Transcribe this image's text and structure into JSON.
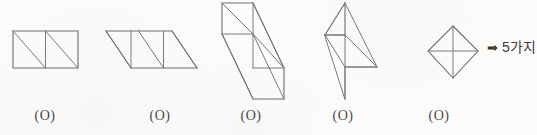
{
  "page": {
    "background_color": "#fdfcfa",
    "line_color": "#6e6e6e",
    "text_color": "#3a3a3a"
  },
  "figures": [
    {
      "id": "figure-1",
      "name": "two-squares-rectangle",
      "caption": "(O)",
      "caption_x": 45,
      "description": "Rectangle made of two unit squares, each crossed by a diagonal from top-left to bottom-right",
      "paths": [
        "M13,31 L78,31 L78,68 L13,68 Z",
        "M45.5,31 L45.5,68",
        "M13,31 L45.5,68",
        "M45.5,31 L78,68"
      ]
    },
    {
      "id": "figure-2",
      "name": "slanted-parallelogram",
      "caption": "(O)",
      "caption_x": 160,
      "description": "Parallelogram of two slanted cells with interior verticals and parallel diagonals",
      "paths": [
        "M106,31 L172,31 L197,68 L131,68 Z",
        "M131,31 L131,68",
        "M163.5,31 L163.5,68",
        "M106,31 L131,68",
        "M138.5,31 L163.5,68",
        "M172,31 L197,68"
      ]
    },
    {
      "id": "figure-3",
      "name": "descending-staircase",
      "caption": "(O)",
      "caption_x": 251,
      "description": "Staircase of squares stepping down to the right with long parallel diagonals",
      "paths": [
        "M222,3 L253,3 L284,68 L284,99 L253,99 L222,34 Z",
        "M222,34 L253,34",
        "M253,68 L284,68",
        "M253,3 L253,34",
        "M253,34 L253,68",
        "M222,3 L253,34",
        "M253,34 L284,68",
        "M253,3 L284,68",
        "M253,34 L284,99",
        "M222,34 L253,99"
      ]
    },
    {
      "id": "figure-4",
      "name": "pinwheel-z-shape",
      "caption": "(O)",
      "caption_x": 343,
      "description": "Z-shaped pinwheel of four right triangles meeting at a central vertical",
      "paths": [
        "M345,3 L345,35 L325,35 Z",
        "M325,35 L345,35 L377,67 L345,67 L345,99 Z",
        "M345,35 L377,67",
        "M345,3 L377,67",
        "M345,35 L345,67",
        "M345,67 L345,99",
        "M325,35 L345,67",
        "M345,67 L377,67"
      ]
    },
    {
      "id": "figure-5",
      "name": "diamond-with-medians",
      "caption": "(O)",
      "caption_x": 439,
      "description": "Diamond (square rotated 45 degrees) divided by a vertical and a horizontal median",
      "paths": [
        "M453,26 L478,51 L453,78 L428,51 Z",
        "M453,26 L453,78",
        "M428,51 L478,51"
      ]
    }
  ],
  "result": {
    "arrow_icon": "right-arrow-icon",
    "arrow_glyph": "➡",
    "text": "5가지"
  }
}
